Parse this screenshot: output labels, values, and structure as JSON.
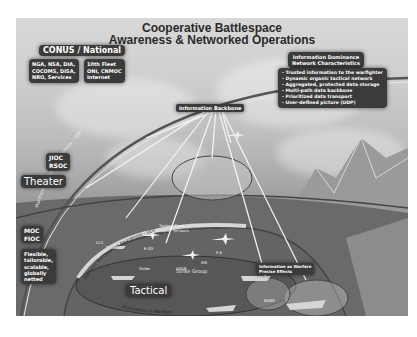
{
  "title": {
    "line1": "Cooperative Battlespace",
    "line2": "Awareness & Networked Operations"
  },
  "conus": {
    "header": "CONUS / National",
    "col1": [
      "NGA, NSA, DIA,",
      "COCOMS, DISA,",
      "NRO, Services"
    ],
    "col2": [
      "10th Fleet",
      "ONI, CNMOC",
      "Internet"
    ]
  },
  "info_dominance": {
    "header_line1": "Information Dominance",
    "header_line2": "Network Characteristics",
    "bullets": [
      "Trusted information to the warfighter",
      "Dynamic organic tactical network",
      "Aggregated, protected data storage",
      "Multi-path data backbone",
      "Prioritized data transport",
      "User-defined picture (UDP)"
    ]
  },
  "backbone": {
    "label": "Information Backbone"
  },
  "theater": {
    "centers": [
      "JIOC",
      "RSOC"
    ],
    "label": "Theater"
  },
  "moc": {
    "centers": [
      "MOC",
      "FIOC"
    ],
    "traits": [
      "Flexible,",
      "tailorable,",
      "scalable,",
      "globally",
      "netted"
    ]
  },
  "tactical": {
    "label": "Tactical",
    "strike_group": "Strike Group",
    "arc_text": "Information in Warfare"
  },
  "arcs": {
    "outer": "Maritime Battlespace Awareness - UDP",
    "inner": "Maritime Battlespace Awareness - UDP"
  },
  "right_box": {
    "line1": "Information as Warfare",
    "line2": "Precise Effects"
  },
  "small_labels": {
    "tactical_fleet": "Tactical Fleet",
    "transport_network": "Transport Network",
    "ssgn": "SSGN",
    "strike": "Strike",
    "e2d": "E-2D",
    "f8": "F-8",
    "isr": "ISR",
    "lcs": "LCS",
    "bams": "BAMS",
    "sat": "Satellite",
    "mmap": "MMA"
  },
  "colors": {
    "label_bg": "#3b3b3b",
    "label_fg": "#ffffff",
    "title": "#2a2a2a",
    "sky": "#cfcfcf",
    "sea": "#6e6e6e"
  }
}
